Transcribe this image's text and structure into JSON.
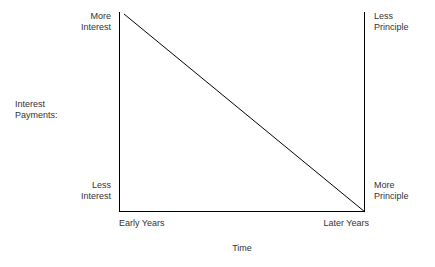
{
  "chart_data": {
    "type": "line",
    "title": "",
    "subtitle": "",
    "xlabel": "Time",
    "ylabel": "Interest Payments:",
    "x": [
      0,
      1
    ],
    "values": [
      1,
      0
    ],
    "series": [
      {
        "name": "Interest payment portion",
        "values": [
          1,
          0
        ]
      }
    ],
    "categories": [
      "Early Years",
      "Later Years"
    ],
    "xticklabels": [
      "Early Years",
      "Later Years"
    ],
    "left_axis_labels": {
      "top": "More\nInterest",
      "bottom": "Less\nInterest"
    },
    "right_axis_labels": {
      "top": "Less\nPrinciple",
      "bottom": "More\nPrinciple"
    },
    "xlim": [
      0,
      1
    ],
    "ylim": [
      0,
      1
    ],
    "grid": false,
    "legend": "none",
    "annotations": [],
    "line_color": "#000000",
    "axis_color": "#000000",
    "text_color": "#333333",
    "background_color": "#ffffff"
  },
  "labels": {
    "top_left": "More\nInterest",
    "bottom_left": "Less\nInterest",
    "top_right": "Less\nPrinciple",
    "bottom_right": "More\nPrinciple",
    "y_axis_title": "Interest\nPayments:",
    "x_tick_start": "Early Years",
    "x_tick_end": "Later Years",
    "x_axis_title": "Time"
  }
}
